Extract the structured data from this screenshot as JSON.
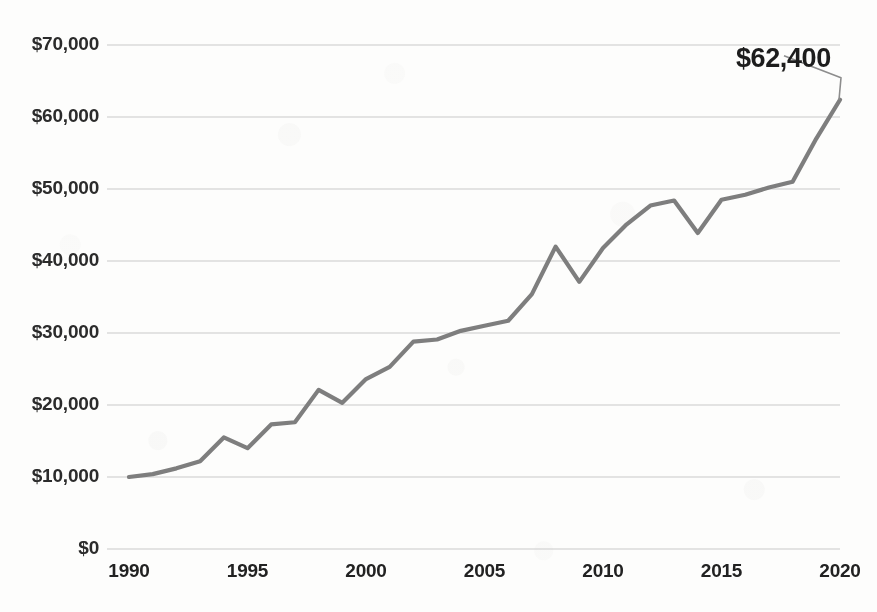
{
  "chart_data": {
    "type": "line",
    "title": "",
    "subtitle": "",
    "xlabel": "",
    "ylabel": "",
    "xlim": [
      1990,
      2020
    ],
    "ylim": [
      0,
      70000
    ],
    "grid": "horizontal",
    "legend": "none",
    "line_color": "#7e7e7e",
    "x": [
      1990,
      1991,
      1992,
      1993,
      1994,
      1995,
      1996,
      1997,
      1998,
      1999,
      2000,
      2001,
      2002,
      2003,
      2004,
      2005,
      2006,
      2007,
      2008,
      2009,
      2010,
      2011,
      2012,
      2013,
      2014,
      2015,
      2016,
      2017,
      2018,
      2019,
      2020
    ],
    "values": [
      10000,
      10400,
      11200,
      12200,
      15500,
      14000,
      17300,
      17600,
      22100,
      20300,
      23600,
      25300,
      28800,
      29100,
      30300,
      31000,
      31700,
      35400,
      42000,
      37100,
      41800,
      45100,
      47700,
      48400,
      43900,
      48500,
      49200,
      50200,
      51000,
      57000,
      62400
    ],
    "x_ticks": [
      1990,
      1995,
      2000,
      2005,
      2010,
      2015,
      2020
    ],
    "x_tick_labels": [
      "1990",
      "1995",
      "2000",
      "2005",
      "2010",
      "2015",
      "2020"
    ],
    "y_ticks": [
      0,
      10000,
      20000,
      30000,
      40000,
      50000,
      60000,
      70000
    ],
    "y_tick_labels": [
      "$0",
      "$10,000",
      "$20,000",
      "$30,000",
      "$40,000",
      "$50,000",
      "$60,000",
      "$70,000"
    ],
    "annotations": [
      {
        "name": "endpoint-value",
        "text": "$62,400",
        "x": 2020,
        "y": 62400
      }
    ]
  }
}
